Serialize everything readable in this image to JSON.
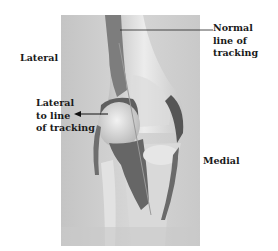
{
  "figure": {
    "background_color": "#ffffff",
    "photo_bg_color": "#cfcfcf"
  },
  "labels": {
    "normal_tracking": [
      "Normal",
      "line of",
      "tracking"
    ],
    "lateral": "Lateral",
    "lateral_to_line": [
      "Lateral",
      "to line",
      "of tracking"
    ],
    "medial": "Medial"
  },
  "annotations": {
    "normal_tracking_leader": "line",
    "lateral_to_line_leader": "arrow"
  }
}
